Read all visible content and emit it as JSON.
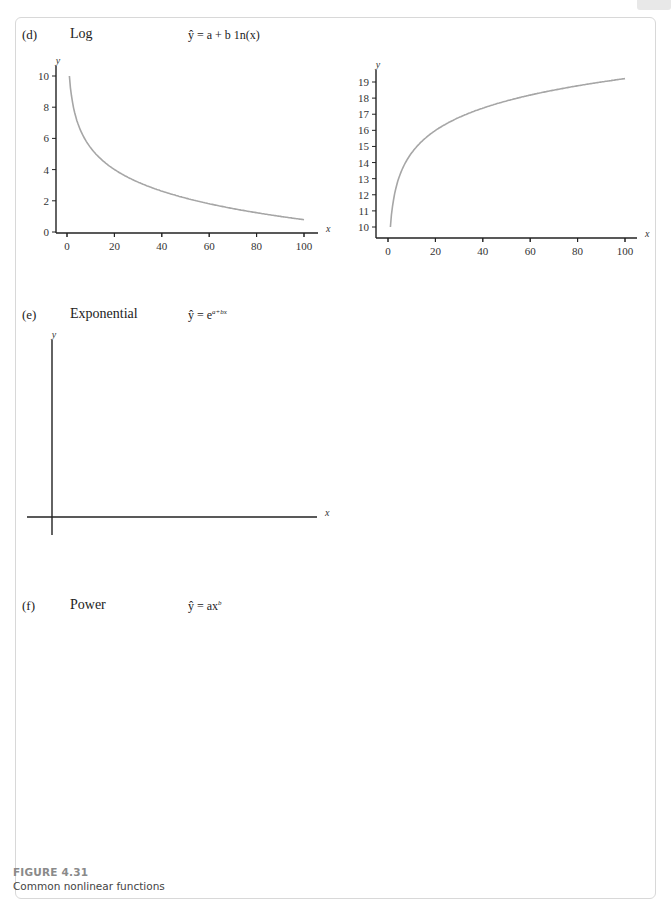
{
  "figure": {
    "number": "FIGURE 4.31",
    "caption": "Common nonlinear functions"
  },
  "panels": {
    "d": {
      "label": "(d)",
      "name": "Log",
      "equation": "ŷ = a + b 1n(x)"
    },
    "e": {
      "label": "(e)",
      "name": "Exponential",
      "equation": "ŷ = e",
      "equation_sup": "a+bx"
    },
    "f": {
      "label": "(f)",
      "name": "Power",
      "equation": "ŷ = ax",
      "equation_sup": "b"
    }
  },
  "colors": {
    "curve": "#a6a6a6",
    "axis": "#222222",
    "frame": "#d8d8d8",
    "figure_label": "#8a8a8a"
  },
  "chart_data": [
    {
      "id": "log-decreasing",
      "type": "line",
      "title": "Log (b < 0)",
      "xlabel": "x",
      "ylabel": "y",
      "xlim": [
        0,
        100
      ],
      "ylim": [
        0,
        10
      ],
      "xticks": [
        0,
        20,
        40,
        60,
        80,
        100
      ],
      "yticks": [
        0,
        2,
        4,
        6,
        8,
        10
      ],
      "series": [
        {
          "name": "y = 10 - 2 ln(x)",
          "x": [
            1,
            2,
            5,
            10,
            20,
            30,
            40,
            50,
            60,
            70,
            80,
            90,
            100
          ],
          "values": [
            10.0,
            8.6,
            6.8,
            5.4,
            4.0,
            3.2,
            2.6,
            2.2,
            1.8,
            1.5,
            1.2,
            1.0,
            0.8
          ]
        }
      ],
      "grid": false
    },
    {
      "id": "log-increasing",
      "type": "line",
      "title": "Log (b > 0)",
      "xlabel": "x",
      "ylabel": "y",
      "xlim": [
        0,
        100
      ],
      "ylim": [
        10,
        19
      ],
      "xticks": [
        0,
        20,
        40,
        60,
        80,
        100
      ],
      "yticks": [
        10,
        11,
        12,
        13,
        14,
        15,
        16,
        17,
        18,
        19
      ],
      "series": [
        {
          "name": "y = 10 + 2 ln(x)",
          "x": [
            1,
            2,
            5,
            10,
            20,
            30,
            40,
            50,
            60,
            70,
            80,
            90,
            100
          ],
          "values": [
            10.0,
            11.4,
            13.2,
            14.6,
            16.0,
            16.8,
            17.4,
            17.8,
            18.2,
            18.5,
            18.8,
            19.0,
            19.2
          ]
        }
      ],
      "grid": false
    },
    {
      "id": "exp-increasing",
      "type": "line",
      "title": "Exponential (b > 0)",
      "xlabel": "x",
      "ylabel": "y",
      "xlim": [
        -1,
        10
      ],
      "ylim": [
        0,
        10
      ],
      "xticks": [
        5,
        10
      ],
      "xminor": [
        1,
        2,
        3,
        4,
        6,
        7,
        8,
        9
      ],
      "yticks": [
        5,
        10
      ],
      "yminor": [
        1,
        2,
        3,
        4,
        6,
        7,
        8,
        9
      ],
      "series": [
        {
          "name": "y = e^(0.26x)",
          "x": [
            -1,
            0,
            1,
            2,
            3,
            4,
            5,
            6,
            7,
            8,
            8.8
          ],
          "values": [
            0.77,
            1.0,
            1.3,
            1.68,
            2.18,
            2.83,
            3.67,
            4.76,
            6.17,
            8.0,
            9.9
          ]
        }
      ],
      "grid": false
    },
    {
      "id": "exp-decreasing",
      "type": "line",
      "title": "Exponential (b < 0)",
      "xlabel": "x",
      "ylabel": "y",
      "xlim": [
        -0.5,
        8
      ],
      "ylim": [
        0,
        2.0
      ],
      "xticks": [
        2,
        4,
        6,
        8
      ],
      "xminor": [
        1,
        3,
        5,
        7
      ],
      "yticks": [
        0.5,
        1.0,
        1.5,
        2.0
      ],
      "ytick_labels": [
        "0.5",
        "1.0",
        "1.5",
        "2.0"
      ],
      "series": [
        {
          "name": "y = e^(-0.54x)",
          "x": [
            -0.5,
            0,
            1,
            2,
            3,
            4,
            5,
            6,
            7,
            8
          ],
          "values": [
            1.31,
            1.0,
            0.58,
            0.34,
            0.2,
            0.12,
            0.07,
            0.04,
            0.02,
            0.01
          ]
        }
      ],
      "grid": false
    },
    {
      "id": "power",
      "type": "line",
      "title": "Power",
      "xlabel": "x",
      "ylabel": "y",
      "xlim": [
        0,
        5
      ],
      "ylim": [
        0,
        5
      ],
      "xticks": [
        1,
        2,
        3,
        4,
        5
      ],
      "yticks": [
        1,
        2,
        3,
        4,
        5
      ],
      "series": [
        {
          "name": "b = 3",
          "exponent": 3,
          "x": [
            0,
            0.5,
            1,
            1.5,
            1.71
          ],
          "values": [
            0,
            0.13,
            1,
            3.38,
            5.0
          ]
        },
        {
          "name": "b = 2",
          "exponent": 2,
          "x": [
            0,
            0.5,
            1,
            1.5,
            2,
            2.24
          ],
          "values": [
            0,
            0.25,
            1,
            2.25,
            4,
            5.0
          ]
        },
        {
          "name": "b = 1",
          "exponent": 1,
          "x": [
            0,
            1,
            2,
            3,
            4,
            5
          ],
          "values": [
            0,
            1,
            2,
            3,
            4,
            5
          ]
        },
        {
          "name": "b = 1/2",
          "exponent": 0.5,
          "x": [
            0,
            1,
            2,
            3,
            4,
            5
          ],
          "values": [
            0,
            1,
            1.41,
            1.73,
            2.0,
            2.24
          ]
        },
        {
          "name": "b = 1/3",
          "exponent": 0.3333,
          "x": [
            0,
            1,
            2,
            3,
            4,
            5
          ],
          "values": [
            0,
            1,
            1.26,
            1.44,
            1.59,
            1.71
          ]
        },
        {
          "name": "b = -1",
          "exponent": -1,
          "x": [
            0.2,
            0.5,
            1,
            2,
            3,
            4,
            5
          ],
          "values": [
            5.0,
            2.0,
            1,
            0.5,
            0.33,
            0.25,
            0.2
          ]
        }
      ],
      "grid": false
    }
  ]
}
